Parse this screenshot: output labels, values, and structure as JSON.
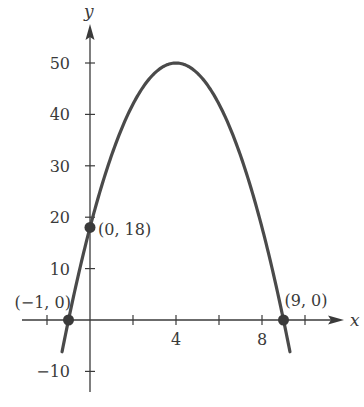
{
  "chart_data": {
    "type": "line",
    "title": "",
    "xlabel": "x",
    "ylabel": "y",
    "function": "y = -2x^2 + 16x + 18",
    "xlim": [
      -3,
      11.5
    ],
    "ylim": [
      -12,
      55
    ],
    "x_ticks": [
      -2,
      0,
      2,
      4,
      6,
      8,
      10
    ],
    "x_tick_labels": [
      {
        "value": 4,
        "label": "4"
      },
      {
        "value": 8,
        "label": "8"
      }
    ],
    "y_ticks": [
      -10,
      10,
      20,
      30,
      40,
      50
    ],
    "y_tick_labels": [
      {
        "value": 50,
        "label": "50"
      },
      {
        "value": 40,
        "label": "40"
      },
      {
        "value": 30,
        "label": "30"
      },
      {
        "value": 20,
        "label": "20"
      },
      {
        "value": 10,
        "label": "10"
      },
      {
        "value": -10,
        "label": "−10"
      }
    ],
    "curve_x_range": [
      -1.3,
      9.3
    ],
    "points": [
      {
        "x": -1,
        "y": 0,
        "label": "(−1, 0)"
      },
      {
        "x": 0,
        "y": 18,
        "label": "(0, 18)"
      },
      {
        "x": 9,
        "y": 0,
        "label": "(9, 0)"
      }
    ],
    "vertex": {
      "x": 4,
      "y": 50
    },
    "grid": false,
    "colors": {
      "curve": "#4a4a4a",
      "axis": "#3a3a3a",
      "point": "#3a3a3a"
    }
  }
}
